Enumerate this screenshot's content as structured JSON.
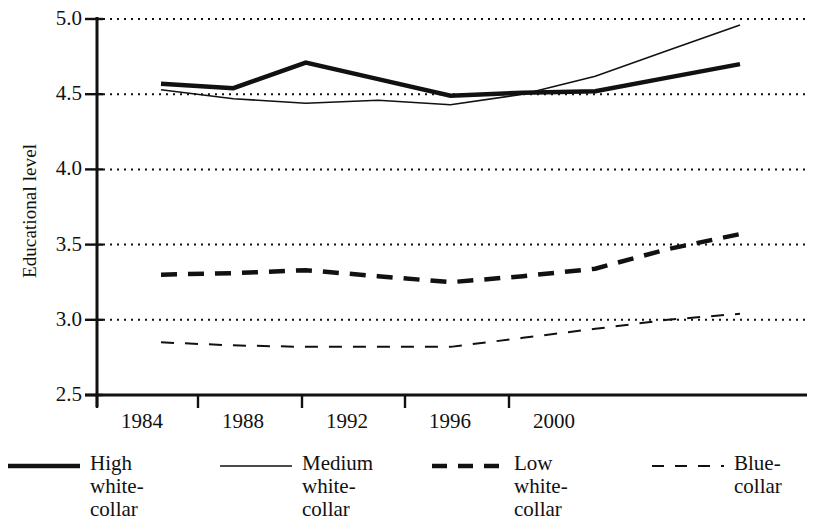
{
  "chart_data": {
    "type": "line",
    "title": "",
    "xlabel": "",
    "ylabel": "Educational level",
    "x": [
      1984,
      1986,
      1988,
      1990,
      1992,
      1994,
      1996,
      1998,
      2000
    ],
    "xticks": [
      1984,
      1988,
      1992,
      1996,
      2000
    ],
    "xtick_labels": [
      "1984",
      "1988",
      "1992",
      "1996",
      "2000"
    ],
    "yticks": [
      2.5,
      3.0,
      3.5,
      4.0,
      4.5,
      5.0
    ],
    "ytick_labels": [
      "2.5",
      "3.0",
      "3.5",
      "4.0",
      "4.5",
      "5.0"
    ],
    "ylim": [
      2.5,
      5.0
    ],
    "xlim": [
      1982.5,
      2001.5
    ],
    "grid": "horizontal-dotted",
    "legend_position": "below",
    "series": [
      {
        "name": "High white-collar",
        "label_lines": [
          "High white-",
          "collar"
        ],
        "style": "solid-thick",
        "color": "#111111",
        "width": 4.5,
        "values": [
          4.57,
          4.54,
          4.71,
          4.6,
          4.49,
          4.51,
          4.52,
          4.61,
          4.7
        ]
      },
      {
        "name": "Medium white-collar",
        "label_lines": [
          "Medium white-",
          "collar"
        ],
        "style": "solid-thin",
        "color": "#111111",
        "width": 1.6,
        "values": [
          4.53,
          4.47,
          4.44,
          4.46,
          4.43,
          4.5,
          4.62,
          4.79,
          4.96
        ]
      },
      {
        "name": "Low white-collar",
        "label_lines": [
          "Low white-",
          "collar"
        ],
        "style": "dashed-thick",
        "color": "#111111",
        "width": 4.5,
        "values": [
          3.3,
          3.31,
          3.33,
          3.29,
          3.25,
          3.29,
          3.34,
          3.47,
          3.57
        ]
      },
      {
        "name": "Blue-collar",
        "label_lines": [
          "Blue-",
          "collar"
        ],
        "style": "dashed-thin",
        "color": "#111111",
        "width": 2.0,
        "values": [
          2.85,
          2.83,
          2.82,
          2.82,
          2.82,
          2.88,
          2.94,
          3.0,
          3.04
        ]
      }
    ]
  },
  "axis": {
    "y_title": "Educational level"
  },
  "legend": {
    "items": [
      {
        "label": "High white-\ncollar",
        "style": "solid-thick"
      },
      {
        "label": "Medium white-\ncollar",
        "style": "solid-thin"
      },
      {
        "label": "Low white-\ncollar",
        "style": "dashed-thick"
      },
      {
        "label": "Blue-\ncollar",
        "style": "dashed-thin"
      }
    ]
  }
}
